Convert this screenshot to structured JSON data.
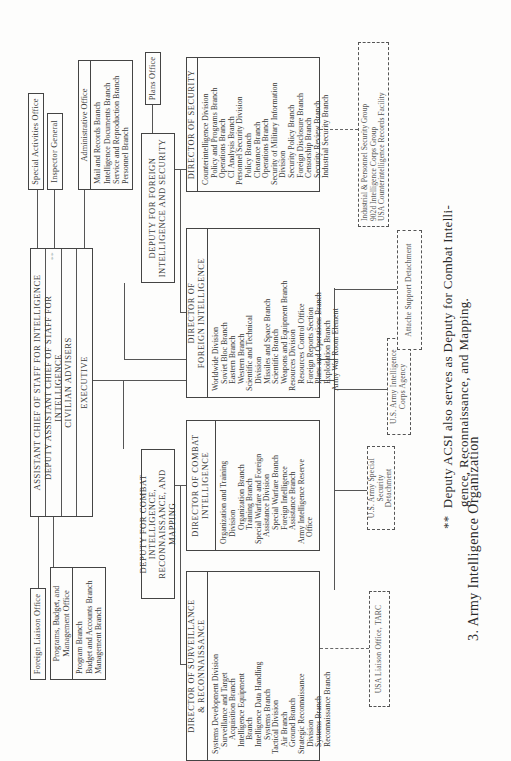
{
  "chart": {
    "acsi": {
      "title": "ASSISTANT CHIEF OF STAFF FOR INTELLIGENCE",
      "deputy": "DEPUTY ASSISTANT CHIEF OF STAFF FOR INTELLIGENCE",
      "deputy_mark": "**",
      "civilian_advisers": "CIVILIAN ADVISERS",
      "executive": "EXECUTIVE"
    },
    "staff_offices": {
      "special_activities": "Special Activities Office",
      "inspector_general": "Inspector General",
      "foreign_liaison": "Foreign Liaison Office",
      "administrative": {
        "title": "Administrative Office",
        "branches": [
          "Mail and Records Branch",
          "Intelligence Documents Branch",
          "Service and Reproduction Branch",
          "Personnel Branch"
        ]
      },
      "programs_budget": {
        "title": "Programs, Budget, and\nManagement Office",
        "branches": [
          "Program Branch",
          "Budget and Accounts Branch",
          "Management Branch"
        ]
      }
    },
    "deputy_foreign": {
      "title": "DEPUTY FOR FOREIGN\nINTELLIGENCE AND SECURITY",
      "plans_office": "Plans Office"
    },
    "deputy_combat": {
      "title": "DEPUTY FOR COMBAT INTELLIGENCE,\nRECONNAISSANCE, AND MAPPING"
    },
    "director_security": {
      "title": "DIRECTOR OF SECURITY",
      "items": [
        {
          "text": "Counterintelligence Division",
          "level": 0
        },
        {
          "text": "Policy and Programs Branch",
          "level": 1
        },
        {
          "text": "Operations Branch",
          "level": 1
        },
        {
          "text": "CI Analysis Branch",
          "level": 1
        },
        {
          "text": "Personnel Security Division",
          "level": 0
        },
        {
          "text": "Policy Branch",
          "level": 1
        },
        {
          "text": "Clearance Branch",
          "level": 1
        },
        {
          "text": "Operations Branch",
          "level": 1
        },
        {
          "text": "Security of Military Information",
          "level": 0
        },
        {
          "text": "Division",
          "level": 1
        },
        {
          "text": "Security Policy Branch",
          "level": 1
        },
        {
          "text": "Foreign Disclosure Branch",
          "level": 1
        },
        {
          "text": "Censorship Branch",
          "level": 1
        },
        {
          "text": "Security Review Branch",
          "level": 1
        },
        {
          "text": "Industrial Security Branch",
          "level": 1
        }
      ]
    },
    "director_foreign": {
      "title": "DIRECTOR OF\nFOREIGN INTELLIGENCE",
      "items": [
        {
          "text": "Worldwide Division",
          "level": 0
        },
        {
          "text": "Soviet Bloc Branch",
          "level": 1
        },
        {
          "text": "Eastern Branch",
          "level": 1
        },
        {
          "text": "Western Branch",
          "level": 1
        },
        {
          "text": "Scientific and Technical",
          "level": 0
        },
        {
          "text": "Division",
          "level": 1
        },
        {
          "text": "Missiles and Space Branch",
          "level": 1
        },
        {
          "text": "Scientific Branch",
          "level": 1
        },
        {
          "text": "Weapons and Equipment Branch",
          "level": 1
        },
        {
          "text": "Resources Division",
          "level": 0
        },
        {
          "text": "Resources Control Office",
          "level": 1
        },
        {
          "text": "Foreign Reports Section",
          "level": 1
        },
        {
          "text": "Plans and Operations Branch",
          "level": 1
        },
        {
          "text": "Exploitation Branch",
          "level": 1
        },
        {
          "text": "Army War Room Element",
          "level": 0
        }
      ]
    },
    "director_combat": {
      "title": "DIRECTOR OF COMBAT\nINTELLIGENCE",
      "items": [
        {
          "text": "Organization and Training",
          "level": 0
        },
        {
          "text": "Division",
          "level": 1
        },
        {
          "text": "Organization Branch",
          "level": 2
        },
        {
          "text": "Training Branch",
          "level": 2
        },
        {
          "text": "Special Warfare and Foreign",
          "level": 0
        },
        {
          "text": "Assistance Division",
          "level": 1
        },
        {
          "text": "Special Warfare Branch",
          "level": 2
        },
        {
          "text": "Foreign Intelligence",
          "level": 2
        },
        {
          "text": "Assistance Branch",
          "level": 2
        },
        {
          "text": "Army Intelligence Reserve",
          "level": 0
        },
        {
          "text": "Office",
          "level": 1
        }
      ]
    },
    "director_surveillance": {
      "title": "DIRECTOR OF SURVEILLANCE\n& RECONNAISSANCE",
      "items": [
        {
          "text": "Systems Development Division",
          "level": 0
        },
        {
          "text": "Surveillance and Target",
          "level": 1
        },
        {
          "text": "Acquisition Branch",
          "level": 2
        },
        {
          "text": "Intelligence Equipment",
          "level": 1
        },
        {
          "text": "Branch",
          "level": 2
        },
        {
          "text": "Intelligence Data Handling",
          "level": 1
        },
        {
          "text": "Systems Branch",
          "level": 2
        },
        {
          "text": "Tactical Division",
          "level": 0
        },
        {
          "text": "Air Branch",
          "level": 1
        },
        {
          "text": "Ground Branch",
          "level": 1
        },
        {
          "text": "Strategic Reconnaissance",
          "level": 0
        },
        {
          "text": "Division",
          "level": 1
        },
        {
          "text": "Systems Branch",
          "level": 1
        },
        {
          "text": "Reconnaissance Branch",
          "level": 1
        }
      ]
    },
    "field_units": {
      "security_groups": [
        "Industrial & Personnel Security Group",
        "902d Intelligence Corps Group",
        "USA Counterintelligence Records Facility"
      ],
      "liaison_tarc": "USA Liaison Office, TARC",
      "special_security_detachment": "U.S. Army Special Security\nDetachment",
      "intelligence_corps_agency": "U.S. Army Intelligence\nCorps Agency",
      "attache_support": "Attache Support Detachment"
    }
  },
  "caption": "3.   Army Intelligence Organization",
  "footnote": {
    "mark": "**",
    "line1": "Deputy ACSI also serves as Deputy for Combat Intelli-",
    "line2": "gence, Reconnaissance, and Mapping."
  }
}
